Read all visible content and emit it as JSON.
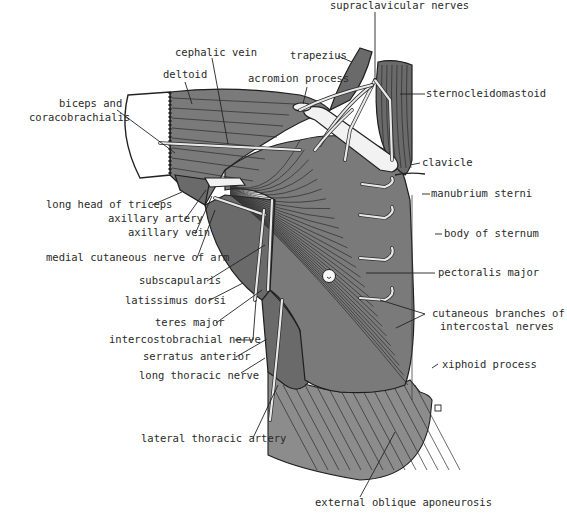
{
  "figure": {
    "colors": {
      "muscle": "#7a7a7a",
      "muscle_dark": "#6a6a6a",
      "nerve": "#e8e8e8",
      "outline": "#1e1e1e",
      "label": "#2a2a2a",
      "background": "#ffffff"
    },
    "labels": {
      "supraclavicular_nerves": "supraclavicular nerves",
      "trapezius": "trapezius",
      "cephalic_vein": "cephalic vein",
      "acromion_process": "acromion process",
      "deltoid": "deltoid",
      "sternocleidomastoid": "sternocleidomastoid",
      "biceps_line1": "biceps and",
      "biceps_line2": "coracobrachialis",
      "clavicle": "clavicle",
      "long_head_triceps": "long head of triceps",
      "manubrium_sterni": "manubrium sterni",
      "axillary_artery": "axillary artery",
      "axillary_vein": "axillary vein",
      "body_of_sternum": "body of sternum",
      "medial_cutaneous_nerve": "medial cutaneous nerve of arm",
      "subscapularis": "subscapularis",
      "pectoralis_major": "pectoralis major",
      "latissimus_dorsi": "latissimus dorsi",
      "cutaneous_line1": "cutaneous branches of",
      "cutaneous_line2": "intercostal nerves",
      "teres_major": "teres major",
      "intercostobrachial_nerve": "intercostobrachial nerve",
      "serratus_anterior": "serratus anterior",
      "xiphoid_process": "xiphoid process",
      "long_thoracic_nerve": "long thoracic nerve",
      "lateral_thoracic_artery": "lateral thoracic artery",
      "external_oblique_aponeurosis": "external oblique aponeurosis"
    }
  }
}
